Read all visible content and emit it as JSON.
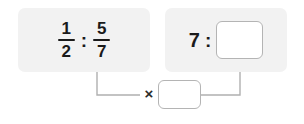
{
  "canvas": {
    "width": 304,
    "height": 124,
    "background": "#ffffff"
  },
  "theme": {
    "panel_background": "#f2f2f2",
    "box_background": "#ffffff",
    "box_border": "#b4b4b4",
    "text_color": "#1a1a1a",
    "connector_color": "#b0b0b0"
  },
  "left_panel": {
    "name": "given-ratio-panel",
    "ratio": {
      "left_term": {
        "type": "fraction",
        "numerator": "1",
        "denominator": "2"
      },
      "separator": ":",
      "right_term": {
        "type": "fraction",
        "numerator": "5",
        "denominator": "7"
      }
    }
  },
  "right_panel": {
    "name": "target-ratio-panel",
    "ratio": {
      "left_term": "7",
      "separator": ":",
      "right_term": {
        "type": "input",
        "value": "",
        "placeholder": ""
      }
    }
  },
  "operation": {
    "operator_label": "×",
    "operator_name": "multiplication-sign",
    "factor_input": {
      "value": "",
      "placeholder": ""
    }
  },
  "connectors": [
    {
      "name": "source-to-operator-connector",
      "from": "left-panel-second-fraction",
      "to": "multiplication-sign",
      "arrowhead": false
    },
    {
      "name": "operator-to-target-connector",
      "from": "factor-input",
      "to": "target-answer-box",
      "arrowhead": true
    }
  ]
}
